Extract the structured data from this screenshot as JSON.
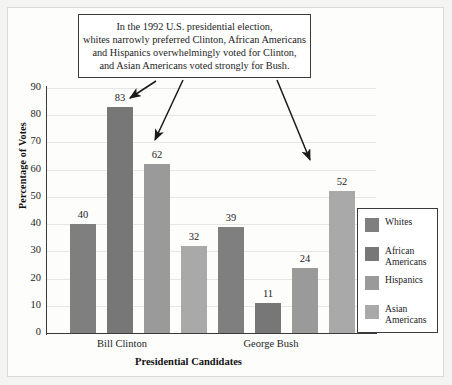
{
  "annotation": {
    "lines": [
      "In the 1992 U.S. presidential election,",
      "whites narrowly preferred Clinton, African Americans",
      "and Hispanics overwhelmingly voted for Clinton,",
      "and Asian Americans voted strongly for Bush."
    ]
  },
  "chart_data": {
    "type": "bar",
    "title": "",
    "xlabel": "Presidential Candidates",
    "ylabel": "Percentage of Votes",
    "categories": [
      "Bill Clinton",
      "George Bush"
    ],
    "series": [
      {
        "name": "Whites",
        "values": [
          40,
          39
        ],
        "color": "#7f7f7f"
      },
      {
        "name": "African Americans",
        "values": [
          83,
          11
        ],
        "color": "#777777"
      },
      {
        "name": "Hispanics",
        "values": [
          62,
          24
        ],
        "color": "#9a9a9a"
      },
      {
        "name": "Asian Americans",
        "values": [
          32,
          52
        ],
        "color": "#a9a9a9"
      }
    ],
    "ylim": [
      0,
      90
    ],
    "yticks": [
      0,
      10,
      20,
      30,
      40,
      50,
      60,
      70,
      80,
      90
    ],
    "grid": true,
    "legend_position": "right"
  },
  "legend": {
    "items": [
      {
        "label_lines": [
          "Whites"
        ]
      },
      {
        "label_lines": [
          "African",
          "Americans"
        ]
      },
      {
        "label_lines": [
          "Hispanics"
        ]
      },
      {
        "label_lines": [
          "Asian",
          "Americans"
        ]
      }
    ]
  }
}
